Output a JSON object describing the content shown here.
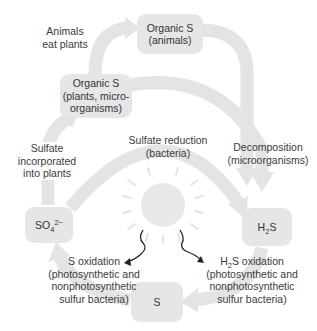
{
  "diagram": {
    "colors": {
      "arrow": "#e4e4e4",
      "box": "#e6e6e6",
      "sun": "#e8e8e8",
      "text": "#3a3a3a",
      "squiggle": "#222222"
    },
    "nodes": {
      "organic_s_animals": {
        "line1": "Organic S",
        "line2": "(animals)"
      },
      "organic_s_plants": {
        "line1": "Organic S",
        "line2": "(plants, micro-",
        "line3": "organisms)"
      },
      "sulfate": {
        "base": "SO",
        "sub": "4",
        "sup": "2−"
      },
      "h2s": {
        "pre": "H",
        "sub": "2",
        "post": "S"
      },
      "s": {
        "label": "S"
      }
    },
    "processes": {
      "animals_eat_plants": {
        "line1": "Animals",
        "line2": "eat plants"
      },
      "sulfate_reduction": {
        "line1": "Sulfate reduction",
        "line2": "(bacteria)"
      },
      "decomposition": {
        "line1": "Decomposition",
        "line2": "(microorganisms)"
      },
      "sulfate_incorporated": {
        "line1": "Sulfate",
        "line2": "incorporated",
        "line3": "into plants"
      },
      "s_oxidation": {
        "line1": "S oxidation",
        "line2": "(photosynthetic and",
        "line3": "nonphotosynthetic",
        "line4": "sulfur bacteria)"
      },
      "h2s_oxidation": {
        "pre": "H",
        "sub": "2",
        "post": "S oxidation",
        "line2": "(photosynthetic and",
        "line3": "nonphotosynthetic",
        "line4": "sulfur bacteria)"
      }
    },
    "center_icon": "sun-icon"
  }
}
